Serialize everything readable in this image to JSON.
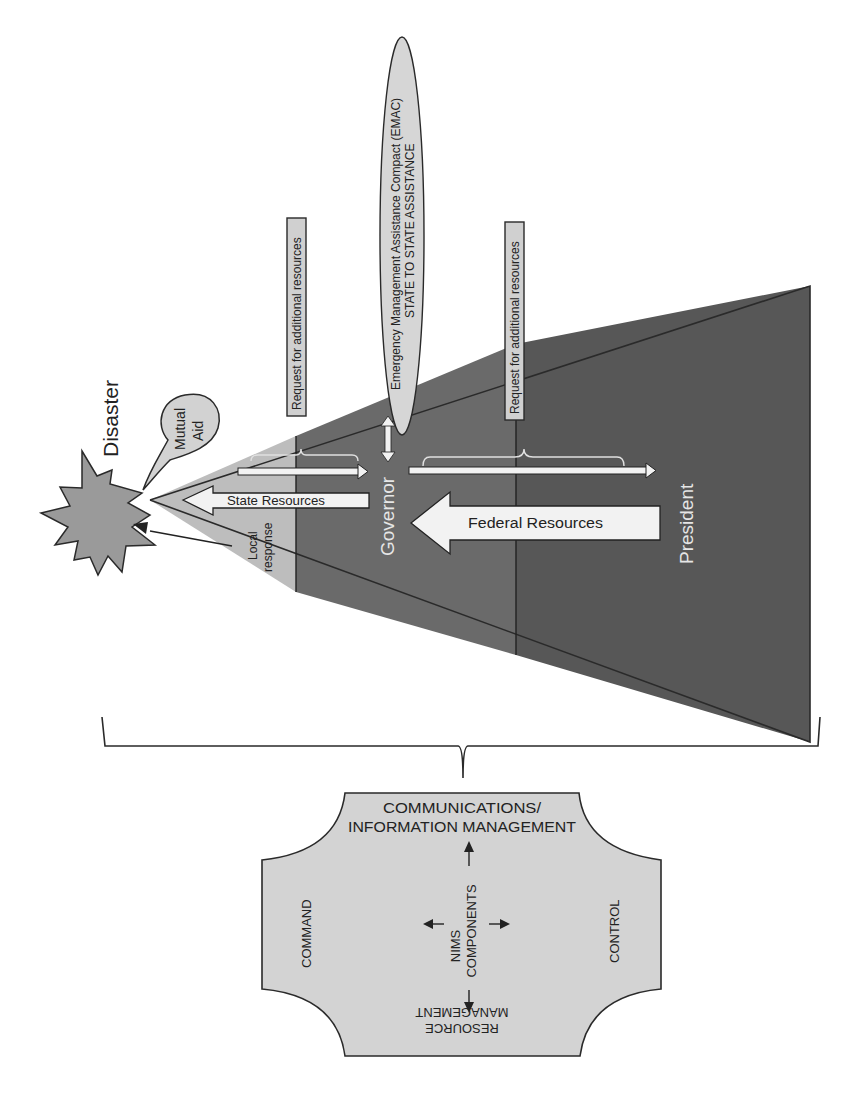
{
  "diagram": {
    "colors": {
      "local_zone": "#bdbdbd",
      "state_zone": "#6a6a6a",
      "federal_zone": "#555555",
      "light_fill": "#d6d6d6",
      "starburst": "#9a9a9a",
      "outline": "#2a2a2a",
      "white_text": "#e8e8e8"
    },
    "disaster": {
      "label": "Disaster",
      "icon": "starburst-icon"
    },
    "mutual_aid": {
      "label_line1": "Mutual",
      "label_line2": "Aid"
    },
    "local_response": {
      "label_line1": "Local",
      "label_line2": "response"
    },
    "state_resources": {
      "label": "State Resources"
    },
    "federal_resources": {
      "label": "Federal Resources"
    },
    "governor": {
      "label": "Governor"
    },
    "president": {
      "label": "President"
    },
    "request_boxes": [
      {
        "label": "Request for additional resources"
      },
      {
        "label": "Request for additional resources"
      }
    ],
    "emac": {
      "line1": "Emergency Management Assistance Compact (EMAC)",
      "line2": "STATE TO STATE ASSISTANCE"
    },
    "nims": {
      "center_line1": "NIMS",
      "center_line2": "COMPONENTS",
      "top_line1": "COMMUNICATIONS/",
      "top_line2": "INFORMATION MANAGEMENT",
      "left": "COMMAND",
      "right": "CONTROL",
      "bottom_line1": "RESOURCE",
      "bottom_line2": "MANAGEMENT"
    }
  }
}
